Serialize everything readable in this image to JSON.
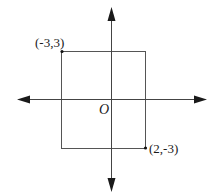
{
  "diagram": {
    "type": "coordinate-plane",
    "axes": {
      "x_axis": {
        "arrows": "both"
      },
      "y_axis": {
        "arrows": "both"
      }
    },
    "origin_label": "O",
    "rectangle": {
      "corners": [
        "(-3,3)",
        "(2,3)",
        "(2,-3)",
        "(-3,-3)"
      ]
    },
    "points": [
      {
        "label": "(-3,3)",
        "x": -3,
        "y": 3
      },
      {
        "label": "(2,-3)",
        "x": 2,
        "y": -3
      }
    ],
    "colors": {
      "axis": "#1a1a1a",
      "rectangle": "#555555",
      "background": "#ffffff"
    }
  }
}
